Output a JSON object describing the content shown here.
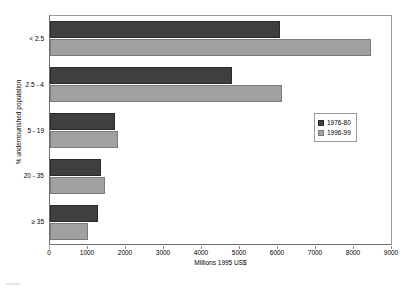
{
  "chart_data": {
    "type": "bar",
    "orientation": "horizontal",
    "title": "",
    "xlabel": "Millions 1995 US$",
    "ylabel": "% undernourished population",
    "categories": [
      "< 2.5",
      "2.5 - 4",
      "5 - 19",
      "20 - 35",
      "≥ 35"
    ],
    "series": [
      {
        "name": "1976-80",
        "color": "#3f3f3f",
        "values": [
          6050,
          4800,
          1700,
          1350,
          1250
        ]
      },
      {
        "name": "1996-99",
        "color": "#a0a0a0",
        "values": [
          8450,
          6100,
          1800,
          1450,
          1000
        ]
      }
    ],
    "xlim": [
      0,
      9000
    ],
    "xticks": [
      0,
      1000,
      2000,
      3000,
      4000,
      5000,
      6000,
      7000,
      8000,
      9000
    ],
    "xtick_labels": [
      "0",
      "1000",
      "2000",
      "3000",
      "4000",
      "5000",
      "6000",
      "7000",
      "8000",
      "9000"
    ],
    "grid": false,
    "legend_position": "center-right",
    "frame": true
  },
  "legend": {
    "entries": [
      {
        "label": "1976-80"
      },
      {
        "label": "1996-99"
      }
    ]
  },
  "colors": {
    "series_1976_80": "#3f3f3f",
    "series_1996_99": "#a0a0a0",
    "axis": "#6e6e6e",
    "background": "#ffffff"
  }
}
